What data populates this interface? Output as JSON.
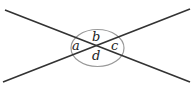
{
  "diagram": {
    "labels": {
      "a": "a",
      "b": "b",
      "c": "c",
      "d": "d"
    },
    "colors": {
      "line": "#333333",
      "arc": "#999999",
      "text": "#222222"
    }
  }
}
